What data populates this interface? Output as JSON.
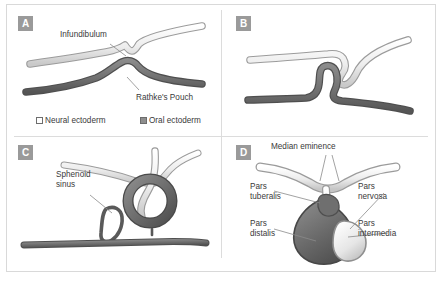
{
  "figure": {
    "panel_count": 4
  },
  "colors": {
    "neural_ectoderm": "#e4e4e4",
    "neural_ectoderm_outline": "#9b9b9b",
    "oral_ectoderm": "#6f6f6f",
    "oral_ectoderm_outline": "#555555",
    "pars_distalis": "#6b6b6b",
    "leader_line": "#8a8a8a",
    "badge_background": "#9a9a9a",
    "badge_text": "#ffffff",
    "frame_border": "#d9d9d9",
    "label_text": "#3a3a3a"
  },
  "legend": {
    "items": [
      {
        "label": "Neural ectoderm",
        "swatch": "white-outlined-square"
      },
      {
        "label": "Oral ectoderm",
        "swatch": "gray-filled-square"
      }
    ]
  },
  "panels": [
    {
      "id": "a",
      "badge": "A",
      "labels": [
        {
          "name": "infundibulum",
          "text": "Infundibulum"
        },
        {
          "name": "rathkes-pouch",
          "text": "Rathke's Pouch"
        }
      ]
    },
    {
      "id": "b",
      "badge": "B",
      "labels": []
    },
    {
      "id": "c",
      "badge": "C",
      "labels": [
        {
          "name": "sphenoid-sinus",
          "line1": "Sphenoid",
          "line2": "sinus"
        }
      ]
    },
    {
      "id": "d",
      "badge": "D",
      "labels": [
        {
          "name": "median-eminence",
          "text": "Median eminence"
        },
        {
          "name": "pars-tuberalis",
          "line1": "Pars",
          "line2": "tuberalis"
        },
        {
          "name": "pars-nervosa",
          "line1": "Pars",
          "line2": "nervosa"
        },
        {
          "name": "pars-distalis",
          "line1": "Pars",
          "line2": "distalis"
        },
        {
          "name": "pars-intermedia",
          "line1": "Pars",
          "line2": "intermedia"
        }
      ]
    }
  ]
}
